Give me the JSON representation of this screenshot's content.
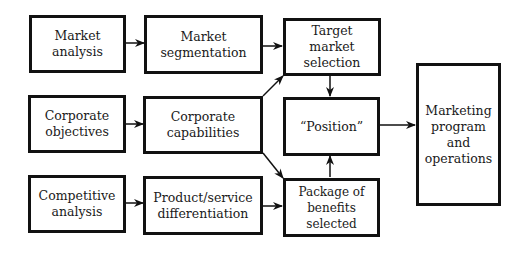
{
  "diagram": {
    "nodes": [
      {
        "id": "market-analysis",
        "label": "Market analysis"
      },
      {
        "id": "market-segmentation",
        "label": "Market\nsegmentation"
      },
      {
        "id": "corporate-objectives",
        "label": "Corporate\nobjectives"
      },
      {
        "id": "corporate-capabilities",
        "label": "Corporate\ncapabilities"
      },
      {
        "id": "competitive-analysis",
        "label": "Competitive\nanalysis"
      },
      {
        "id": "product-differentiation",
        "label": "Product/service\ndifferentiation"
      },
      {
        "id": "target-market-selection",
        "label": "Target market\nselection"
      },
      {
        "id": "position",
        "label": "“Position”"
      },
      {
        "id": "package-of-benefits",
        "label": "Package of\nbenefits selected"
      },
      {
        "id": "marketing-program",
        "label": "Marketing\nprogram and\noperations"
      }
    ],
    "edges": [
      {
        "from": "market-analysis",
        "to": "market-segmentation"
      },
      {
        "from": "corporate-objectives",
        "to": "corporate-capabilities"
      },
      {
        "from": "competitive-analysis",
        "to": "product-differentiation"
      },
      {
        "from": "market-segmentation",
        "to": "target-market-selection"
      },
      {
        "from": "corporate-capabilities",
        "to": "target-market-selection"
      },
      {
        "from": "corporate-capabilities",
        "to": "package-of-benefits"
      },
      {
        "from": "product-differentiation",
        "to": "package-of-benefits"
      },
      {
        "from": "target-market-selection",
        "to": "position"
      },
      {
        "from": "package-of-benefits",
        "to": "position"
      },
      {
        "from": "position",
        "to": "marketing-program"
      }
    ]
  }
}
